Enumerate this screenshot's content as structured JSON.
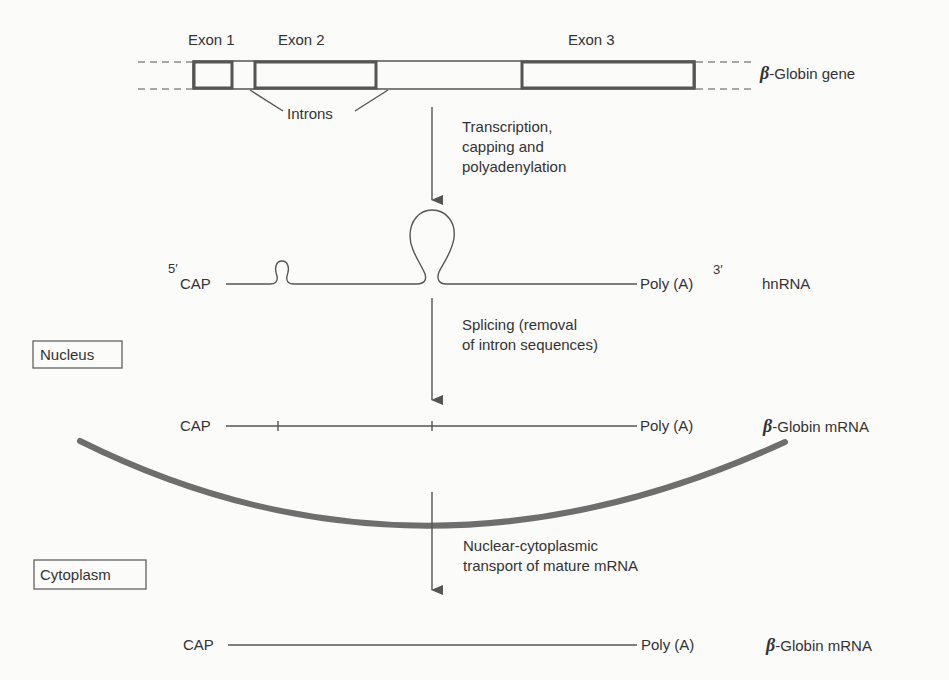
{
  "gene": {
    "exon_labels": [
      "Exon 1",
      "Exon 2",
      "Exon 3"
    ],
    "introns_label": "Introns",
    "beta_symbol": "β",
    "gene_label": "-Globin gene"
  },
  "steps": {
    "transcription": [
      "Transcription,",
      "capping and",
      "polyadenylation"
    ],
    "splicing": [
      "Splicing (removal",
      "of intron sequences)"
    ],
    "transport": [
      "Nuclear-cytoplasmic",
      "transport of mature mRNA"
    ]
  },
  "hnrna": {
    "five_prime": "5′",
    "cap": "CAP",
    "poly_a": "Poly (A)",
    "three_prime": "3′",
    "label": "hnRNA"
  },
  "nuclear_mrna": {
    "cap": "CAP",
    "poly_a": "Poly (A)",
    "beta_symbol": "β",
    "label": "-Globin mRNA"
  },
  "cyto_mrna": {
    "cap": "CAP",
    "poly_a": "Poly (A)",
    "beta_symbol": "β",
    "label": "-Globin mRNA"
  },
  "compartments": {
    "nucleus": "Nucleus",
    "cytoplasm": "Cytoplasm"
  }
}
